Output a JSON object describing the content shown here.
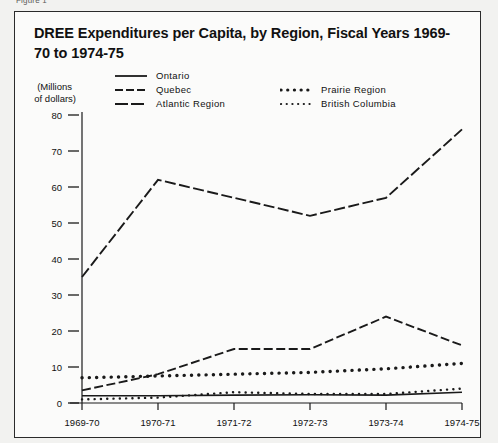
{
  "figure": {
    "caption": "Figure 1"
  },
  "chart_title": "DREE Expenditures per Capita, by Region, Fiscal Years 1969-70 to 1974-75",
  "axis": {
    "y_title_line1": "(Millions",
    "y_title_line2": "of dollars)",
    "y_ticks": [
      "80",
      "70",
      "60",
      "50",
      "40",
      "30",
      "20",
      "10",
      "0"
    ],
    "x_ticks": [
      "1969-70",
      "1970-71",
      "1971-72",
      "1972-73",
      "1973-74",
      "1974-75"
    ]
  },
  "legend": {
    "left": [
      {
        "label": "Ontario",
        "style": "solid",
        "icon": "solid-line-icon"
      },
      {
        "label": "Quebec",
        "style": "long-dash",
        "icon": "long-dash-line-icon"
      },
      {
        "label": "Atlantic Region",
        "style": "medium-dash",
        "icon": "medium-dash-line-icon"
      }
    ],
    "right": [
      {
        "label": "Prairie Region",
        "style": "large-dots",
        "icon": "large-dotted-line-icon"
      },
      {
        "label": "British Columbia",
        "style": "small-dots",
        "icon": "small-dotted-line-icon"
      }
    ]
  },
  "colors": {
    "ink": "#1a1a1a",
    "frame": "#2b2b2b",
    "page_background": "#f2f2f0",
    "panel_background": "#fbfbfa"
  },
  "chart_data": {
    "type": "line",
    "title": "DREE Expenditures per Capita, by Region, Fiscal Years 1969-70 to 1974-75",
    "xlabel": "",
    "ylabel": "(Millions of dollars)",
    "categories": [
      "1969-70",
      "1970-71",
      "1971-72",
      "1972-73",
      "1973-74",
      "1974-75"
    ],
    "ylim": [
      0,
      80
    ],
    "yticks": [
      0,
      10,
      20,
      30,
      40,
      50,
      60,
      70,
      80
    ],
    "grid": false,
    "legend_position": "top",
    "series": [
      {
        "name": "Quebec",
        "style": "long-dash",
        "values": [
          35,
          62,
          57,
          52,
          57,
          76
        ]
      },
      {
        "name": "Atlantic Region",
        "style": "medium-dash",
        "values": [
          3.5,
          8,
          15,
          15,
          24,
          16
        ]
      },
      {
        "name": "Prairie Region",
        "style": "large-dots",
        "values": [
          7,
          7.5,
          8,
          8.5,
          9.5,
          11
        ]
      },
      {
        "name": "British Columbia",
        "style": "small-dots",
        "values": [
          1,
          1.5,
          3,
          2.5,
          2.5,
          4
        ]
      },
      {
        "name": "Ontario",
        "style": "solid",
        "values": [
          2,
          2,
          2.2,
          2.3,
          2.2,
          3
        ]
      }
    ]
  }
}
